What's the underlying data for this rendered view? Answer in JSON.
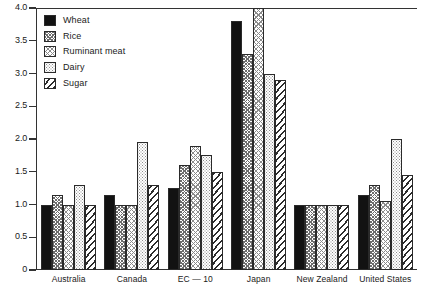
{
  "chart_data": {
    "type": "bar",
    "title": "",
    "subtitle": "",
    "xlabel": "",
    "ylabel": "",
    "ylim": [
      0,
      4.0
    ],
    "ytick_labels": [
      "0",
      "0.5",
      "1.0",
      "1.5",
      "2.0",
      "2.5",
      "3.0",
      "3.5",
      "4.0"
    ],
    "ytick_values": [
      0,
      0.5,
      1.0,
      1.5,
      2.0,
      2.5,
      3.0,
      3.5,
      4.0
    ],
    "grid": false,
    "legend_position": "top-left",
    "categories": [
      "Australia",
      "Canada",
      "EC — 10",
      "Japan",
      "New Zealand",
      "United States"
    ],
    "series": [
      {
        "name": "Wheat",
        "pattern": "solid-black",
        "values": [
          1.0,
          1.15,
          1.25,
          3.8,
          1.0,
          1.15
        ]
      },
      {
        "name": "Rice",
        "pattern": "dense-crosshatch",
        "values": [
          1.15,
          1.0,
          1.6,
          3.3,
          1.0,
          1.3
        ]
      },
      {
        "name": "Ruminant meat",
        "pattern": "crosshatch",
        "values": [
          1.0,
          1.0,
          1.9,
          4.0,
          1.0,
          1.05
        ]
      },
      {
        "name": "Dairy",
        "pattern": "dotted",
        "values": [
          1.3,
          1.95,
          1.75,
          3.0,
          1.0,
          2.0
        ]
      },
      {
        "name": "Sugar",
        "pattern": "diagonal-stripes",
        "values": [
          1.0,
          1.3,
          1.5,
          2.9,
          1.0,
          1.45
        ]
      }
    ]
  }
}
